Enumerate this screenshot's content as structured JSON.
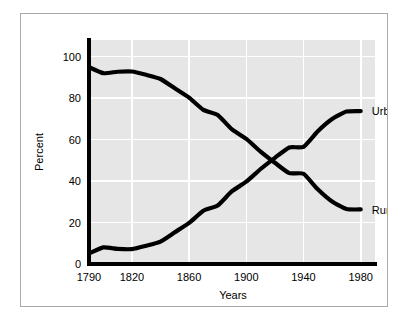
{
  "figure": {
    "background_color": "#ffffff",
    "frame_border_color": "#a9a9a9",
    "plot_background_color": "#e6e6e6",
    "gridline_color": "#ffffff",
    "line_color": "#000000"
  },
  "chart_data": {
    "type": "line",
    "title": "",
    "xlabel": "Years",
    "ylabel": "Percent",
    "xlim": [
      1790,
      1990
    ],
    "ylim": [
      0,
      108
    ],
    "grid": true,
    "legend_position": "inline-right",
    "xticks": [
      1790,
      1820,
      1860,
      1900,
      1940,
      1980
    ],
    "xtick_labels": [
      "1790",
      "1820",
      "1860",
      "1900",
      "1940",
      "1980"
    ],
    "yticks": [
      0,
      20,
      40,
      60,
      80,
      100
    ],
    "ytick_labels": [
      "0",
      "20",
      "40",
      "60",
      "80",
      "100"
    ],
    "x": [
      1790,
      1800,
      1810,
      1820,
      1830,
      1840,
      1850,
      1860,
      1870,
      1880,
      1890,
      1900,
      1910,
      1920,
      1930,
      1940,
      1950,
      1960,
      1970,
      1980
    ],
    "series": [
      {
        "name": "Rural",
        "label": "Rural",
        "label_x": 1985,
        "label_y": 26,
        "values": [
          94.9,
          92.0,
          92.7,
          92.8,
          91.2,
          89.2,
          84.7,
          80.2,
          74.3,
          71.8,
          64.9,
          60.3,
          54.2,
          48.8,
          43.8,
          43.5,
          36.0,
          30.1,
          26.5,
          26.3
        ]
      },
      {
        "name": "Urban",
        "label": "Urban",
        "label_x": 1985,
        "label_y": 74,
        "values": [
          5.1,
          8.0,
          7.3,
          7.2,
          8.8,
          10.8,
          15.3,
          19.8,
          25.7,
          28.2,
          35.1,
          39.7,
          45.8,
          51.2,
          56.2,
          56.5,
          64.0,
          69.9,
          73.5,
          73.7
        ]
      }
    ]
  }
}
